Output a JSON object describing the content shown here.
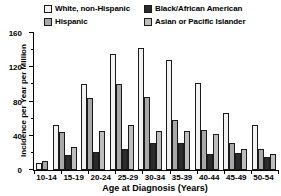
{
  "chart_data": {
    "type": "bar",
    "title": "",
    "xlabel": "Age at Diagnosis (Years)",
    "ylabel": "Incidence per Year per Million",
    "categories": [
      "10-14",
      "15-19",
      "20-24",
      "25-29",
      "30-34",
      "35-39",
      "40-44",
      "45-49",
      "50-54"
    ],
    "series": [
      {
        "name": "White, non-Hispanic",
        "color": "#f2f2f2",
        "values": [
          8,
          52,
          100,
          136,
          142,
          128,
          102,
          67,
          53
        ]
      },
      {
        "name": "Hispanic",
        "color": "#a8a8a8",
        "values": [
          10,
          44,
          84,
          100,
          85,
          58,
          47,
          32,
          25
        ]
      },
      {
        "name": "Black/African American",
        "color": "#2b2b2b",
        "values": [
          0,
          17,
          21,
          25,
          31,
          32,
          19,
          20,
          15
        ]
      },
      {
        "name": "Asian or Pacific Islander",
        "color": "#bdbdbd",
        "values": [
          0,
          27,
          46,
          53,
          46,
          45,
          42,
          25,
          19
        ]
      }
    ],
    "ylim": [
      0,
      160
    ],
    "yticks": [
      0,
      40,
      80,
      120,
      160
    ],
    "yticks_minor": [
      20,
      60,
      100,
      140
    ],
    "grid": false,
    "legend_position": "top"
  },
  "legend": {
    "items": [
      {
        "label": "White, non-Hispanic",
        "color": "#f2f2f2"
      },
      {
        "label": "Black/African American",
        "color": "#2b2b2b"
      },
      {
        "label": "Hispanic",
        "color": "#a8a8a8"
      },
      {
        "label": "Asian or Pacific Islander",
        "color": "#bdbdbd"
      }
    ]
  },
  "axes": {
    "ylabel": "Incidence per Year per Million",
    "xlabel": "Age at Diagnosis (Years)",
    "ytick_labels": [
      "160",
      "120",
      "80",
      "40",
      "0"
    ],
    "xtick_labels": [
      "10-14",
      "15-19",
      "20-24",
      "25-29",
      "30-34",
      "35-39",
      "40-44",
      "45-49",
      "50-54"
    ]
  }
}
